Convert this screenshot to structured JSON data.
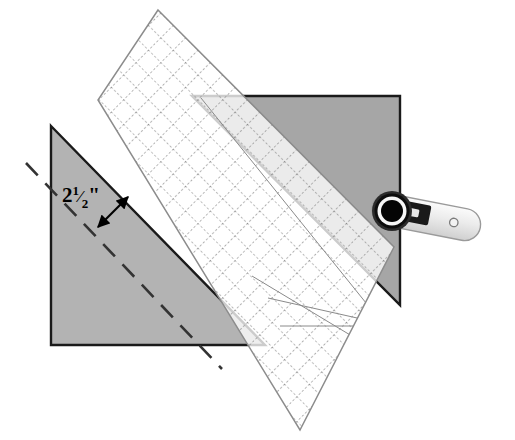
{
  "illustration": {
    "title": "Quilting ruler trimming a fabric triangle",
    "type": "instructional-diagram",
    "canvas": {
      "width": 515,
      "height": 440,
      "background": "#ffffff"
    }
  },
  "annotations": {
    "measurement": {
      "label_whole": "2",
      "label_fraction_numerator": "1",
      "label_fraction_denominator": "2",
      "label_unit": "\"",
      "label_full": "2½\"",
      "x": 62,
      "y": 196,
      "name": "seam-allowance-measurement"
    },
    "dimension_arrow": {
      "x1": 98,
      "y1": 227,
      "x2": 128,
      "y2": 197,
      "name": "dimension-arrow",
      "double_headed": true,
      "color": "#000000"
    }
  },
  "shapes": {
    "left_triangle": {
      "name": "cut-fabric-triangle",
      "points": "51,126 265,345 51,345",
      "fill": "#b3b3b3",
      "stroke": "#1a1a1a",
      "stroke_width": 2.4
    },
    "right_triangle": {
      "name": "fabric-triangle-being-trimmed",
      "points": "192,96 400,96 400,305",
      "fill": "#a6a6a6",
      "stroke": "#1a1a1a",
      "stroke_width": 2.4
    },
    "stitch_line": {
      "name": "stitching-guide-dashed-line",
      "x1": 26,
      "y1": 163,
      "x2": 222,
      "y2": 369,
      "stroke": "#333333",
      "stroke_width": 2.6,
      "dash": "17 11"
    }
  },
  "ruler": {
    "name": "quilting-ruler",
    "fill": "#ffffff",
    "opacity": 0.78,
    "edge_stroke": "#8c8c8c",
    "grid_stroke": "#7a7a7a",
    "grid_spacing": 17.5,
    "corners": [
      [
        158,
        10
      ],
      [
        394,
        247
      ],
      [
        300,
        430
      ],
      [
        98,
        100
      ]
    ],
    "guide_lines": [
      {
        "name": "guide-45-left",
        "x1": 268,
        "y1": 298,
        "x2": 443,
        "y2": 338
      },
      {
        "name": "guide-45-right",
        "x1": 201,
        "y1": 98,
        "x2": 416,
        "y2": 366
      },
      {
        "name": "guide-30",
        "x1": 315,
        "y1": 424,
        "x2": 452,
        "y2": 286
      },
      {
        "name": "guide-60",
        "x1": 258,
        "y1": 279,
        "x2": 448,
        "y2": 392
      },
      {
        "name": "crosshair-horizontal",
        "x1": 295,
        "y1": 326,
        "x2": 470,
        "y2": 326
      },
      {
        "name": "crosshair-vertical",
        "x1": 399,
        "y1": 228,
        "x2": 399,
        "y2": 428
      }
    ]
  },
  "rotary_cutter": {
    "name": "rotary-cutter",
    "blade": {
      "cx": 392,
      "cy": 211,
      "r_outer": 19,
      "r_mid": 15,
      "r_inner": 11,
      "color_outer": "#1a1a1a",
      "color_mid": "#ffffff",
      "color_inner": "#000000",
      "rim": "#4d4d4d"
    },
    "handle": {
      "color": "#e8e8e8",
      "stroke": "#999999",
      "hole_cx": 470,
      "hole_cy": 227,
      "hole_r": 4,
      "hole_stroke": "#808080"
    },
    "guard": {
      "color": "#1a1a1a",
      "name": "blade-guard-latch"
    }
  }
}
